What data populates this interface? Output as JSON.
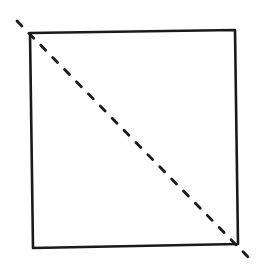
{
  "diagram": {
    "width": 267,
    "height": 275,
    "background": "#ffffff",
    "stroke_color": "#1a1a1a",
    "square": {
      "corners": {
        "top_left": [
          30,
          33
        ],
        "top_right": [
          235,
          30
        ],
        "bottom_right": [
          238,
          244
        ],
        "bottom_left": [
          33,
          248
        ]
      },
      "stroke_width": 2.6
    },
    "diagonal": {
      "from": [
        17,
        21
      ],
      "to": [
        251,
        260
      ],
      "style": "dashed",
      "dash": [
        7,
        10
      ],
      "stroke_width": 2.8
    }
  }
}
